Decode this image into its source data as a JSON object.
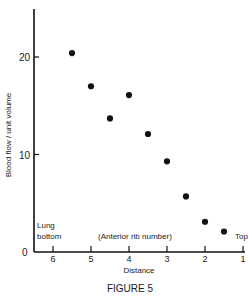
{
  "figure": {
    "caption": "FIGURE 5",
    "xlabel": "Distance",
    "xlabel_note": "(Anterior rib number)",
    "ylabel": "Blood flow / unit volume",
    "left_annotation_line1": "Lung",
    "left_annotation_line2": "bottom",
    "right_annotation": "Top",
    "y_zero_label": "0",
    "y_ticks": [
      {
        "label": "10",
        "value": 10
      },
      {
        "label": "20",
        "value": 20
      }
    ],
    "x_ticks": [
      {
        "label": "6",
        "value": 6
      },
      {
        "label": "5",
        "value": 5
      },
      {
        "label": "4",
        "value": 4
      },
      {
        "label": "3",
        "value": 3
      },
      {
        "label": "2",
        "value": 2
      },
      {
        "label": "1",
        "value": 1
      }
    ]
  },
  "chart_data": {
    "type": "scatter",
    "title": "FIGURE 5",
    "xlabel": "Distance (Anterior rib number)",
    "ylabel": "Blood flow / unit volume",
    "x_direction": "reversed",
    "xlim": [
      6.5,
      1
    ],
    "ylim": [
      0,
      23
    ],
    "xticks": [
      6,
      5,
      4,
      3,
      2,
      1
    ],
    "yticks": [
      0,
      10,
      20
    ],
    "grid": false,
    "legend": null,
    "annotations": [
      "Lung bottom",
      "Top",
      "(Anterior rib number)"
    ],
    "series": [
      {
        "name": "Blood flow",
        "x": [
          5.5,
          5.0,
          4.5,
          4.0,
          3.5,
          3.0,
          2.5,
          2.0,
          1.5
        ],
        "y": [
          20.4,
          17.0,
          13.7,
          16.1,
          12.1,
          9.3,
          5.7,
          3.1,
          2.1
        ]
      }
    ]
  }
}
